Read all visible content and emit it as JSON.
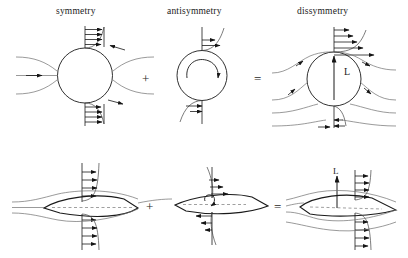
{
  "figure": {
    "title_top_row": [
      "symmetry",
      "antisymmetry",
      "dissymmetry"
    ],
    "operators": [
      "+",
      "=",
      "+",
      "="
    ],
    "lift_label_circle": "L",
    "lift_label_airfoil": "L"
  },
  "labels": {
    "symmetry": "symmetry",
    "antisymmetry": "antisymmetry",
    "dissymmetry": "dissymmetry",
    "plus_top": "+",
    "equals_top": "=",
    "plus_bottom": "+",
    "equals_bottom": "=",
    "lift_top": "L",
    "lift_bottom": "L"
  },
  "panels": [
    {
      "id": "top-symmetry",
      "body": "circle",
      "caption": "symmetry",
      "description": "symmetric potential flow past a circular cylinder with equal upper and lower velocity profiles, zero net lift",
      "has_lift_arrow": false,
      "has_circulation": false
    },
    {
      "id": "top-antisymmetry",
      "body": "circle",
      "caption": "antisymmetry",
      "description": "pure clockwise circulation about the cylinder, velocity profile rightward above and leftward below",
      "has_lift_arrow": false,
      "has_circulation": true,
      "circulation_direction": "clockwise"
    },
    {
      "id": "top-dissymmetry",
      "body": "circle",
      "caption": "dissymmetry",
      "description": "superposition of uniform flow and circulation giving faster flow above, slower below, producing upward lift L",
      "has_lift_arrow": true,
      "has_circulation": false,
      "lift_label": "L"
    },
    {
      "id": "bottom-symmetry",
      "body": "airfoil",
      "caption": "",
      "description": "symmetric airfoil at zero incidence with symmetric velocity profiles and dashed chord line",
      "has_lift_arrow": false,
      "has_circulation": false
    },
    {
      "id": "bottom-antisymmetry",
      "body": "airfoil",
      "caption": "",
      "description": "airfoil with bound circulation only, antisymmetric velocity profiles",
      "has_lift_arrow": false,
      "has_circulation": true,
      "circulation_direction": "clockwise"
    },
    {
      "id": "bottom-dissymmetry",
      "body": "airfoil",
      "caption": "",
      "description": "airfoil at angle of attack with net circulation producing upward lift L",
      "has_lift_arrow": true,
      "has_circulation": false,
      "lift_label": "L"
    }
  ],
  "style": {
    "stroke_dark": "#1a1a1a",
    "stroke_light": "#6e6e6e",
    "background": "#ffffff"
  }
}
